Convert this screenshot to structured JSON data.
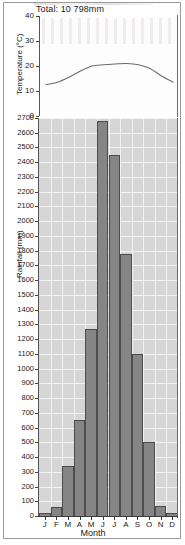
{
  "figure": {
    "title": "Total: 10 798mm",
    "x_axis_title": "Month",
    "temperature_axis_title": "Temperature (°C)",
    "rainfall_axis_title": "Rainfall (mm)"
  },
  "chart_data": [
    {
      "type": "bar",
      "title": "Total: 10 798mm",
      "xlabel": "Month",
      "ylabel": "Rainfall (mm)",
      "categories": [
        "J",
        "F",
        "M",
        "A",
        "M",
        "J",
        "J",
        "A",
        "S",
        "O",
        "N",
        "D"
      ],
      "values": [
        20,
        60,
        340,
        650,
        1270,
        2680,
        2450,
        1780,
        1100,
        500,
        70,
        20
      ],
      "ylim": [
        0,
        2700
      ],
      "ytick_step": 100,
      "yticks": [
        0,
        100,
        200,
        300,
        400,
        500,
        600,
        700,
        800,
        900,
        1000,
        1100,
        1200,
        1300,
        1400,
        1500,
        1600,
        1700,
        1800,
        1900,
        2000,
        2100,
        2200,
        2300,
        2400,
        2500,
        2600,
        2700
      ],
      "grid": true,
      "legend": "none",
      "bar_color": "#858585",
      "plot_background": "#d6d6d6",
      "gridline_color": "#f2f2f2"
    },
    {
      "type": "line",
      "title": "Total: 10 798mm",
      "xlabel": "Month",
      "ylabel": "Temperature (°C)",
      "categories": [
        "J",
        "F",
        "M",
        "A",
        "M",
        "J",
        "J",
        "A",
        "S",
        "O",
        "N",
        "D"
      ],
      "values": [
        12.5,
        13.5,
        15.5,
        18.0,
        20.0,
        20.5,
        20.8,
        21.0,
        20.5,
        19.0,
        16.0,
        13.5
      ],
      "ylim": [
        0,
        40
      ],
      "ytick_step": 10,
      "yticks": [
        0,
        10,
        20,
        30,
        40
      ],
      "grid": false,
      "legend": "none",
      "line_color": "#6d6d6d",
      "plot_background": "#fdfdfd"
    }
  ]
}
